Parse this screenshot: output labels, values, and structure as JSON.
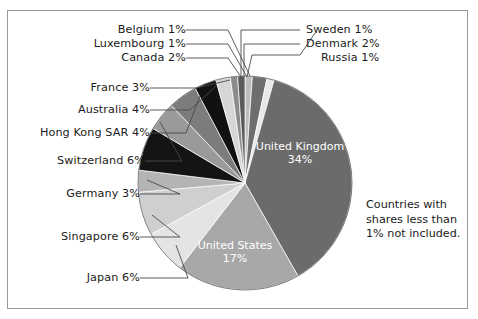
{
  "chart_data": {
    "type": "pie",
    "title": "",
    "subtitle": "",
    "xlabel": "",
    "ylabel": "",
    "legend_position": "none",
    "grid": false,
    "note": "Countries with shares less than 1% not included.",
    "unit": "%",
    "start_angle_deg": 0,
    "direction": "clockwise",
    "categories": [
      "Russia",
      "Denmark",
      "Sweden",
      "United Kingdom",
      "United States",
      "Japan",
      "Singapore",
      "Germany",
      "Switzerland",
      "Hong Kong SAR",
      "Australia",
      "France",
      "Canada",
      "Luxembourg",
      "Belgium"
    ],
    "values": [
      1,
      2,
      1,
      34,
      17,
      6,
      6,
      3,
      6,
      4,
      4,
      3,
      2,
      1,
      1
    ],
    "labels": [
      "Russia 1%",
      "Denmark 2%",
      "Sweden 1%",
      "United Kingdom 34%",
      "United States 17%",
      "Japan 6%",
      "Singapore 6%",
      "Germany 3%",
      "Switzerland 6%",
      "Hong Kong SAR 4%",
      "Australia 4%",
      "France 3%",
      "Canada 2%",
      "Luxembourg 1%",
      "Belgium 1%"
    ],
    "colors": [
      "#bdbdbd",
      "#6e6e6e",
      "#e8e8e8",
      "#6b6b6b",
      "#a8a8a8",
      "#e4e4e4",
      "#cfcfcf",
      "#b4b4b4",
      "#141414",
      "#9a9a9a",
      "#7c7c7c",
      "#111111",
      "#d6d6d6",
      "#8c8c8c",
      "#5a5a5a"
    ]
  },
  "callouts": {
    "left": [
      {
        "text": "Belgium 1%"
      },
      {
        "text": "Luxembourg 1%"
      },
      {
        "text": "Canada 2%"
      },
      {
        "text": "France 3%"
      },
      {
        "text": "Australia 4%"
      },
      {
        "text": "Hong Kong SAR 4%"
      },
      {
        "text": "Switzerland 6%"
      },
      {
        "text": "Germany 3%"
      },
      {
        "text": "Singapore 6%"
      },
      {
        "text": "Japan 6%"
      }
    ],
    "right": [
      {
        "text": "Sweden 1%"
      },
      {
        "text": "Denmark 2%"
      },
      {
        "text": "Russia 1%"
      }
    ]
  },
  "inner_labels": {
    "uk_name": "United Kingdom",
    "uk_value": "34%",
    "us_name": "United States",
    "us_value": "17%"
  },
  "note": {
    "line1": "Countries with",
    "line2": "shares less than",
    "line3": "1% not included."
  }
}
